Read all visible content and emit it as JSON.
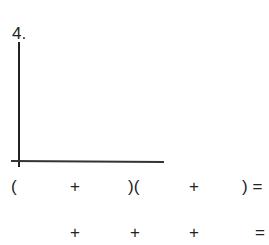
{
  "problem": {
    "number": "4."
  },
  "row1": {
    "open1": "(",
    "plus1": "+",
    "closeopen": ")(",
    "plus2": "+",
    "close_eq": ") ="
  },
  "row2": {
    "plus1": "+",
    "plus2": "+",
    "plus3": "+",
    "eq": "="
  }
}
